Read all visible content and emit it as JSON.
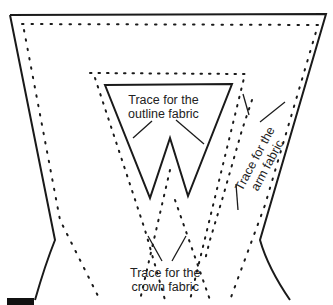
{
  "diagram": {
    "labels": {
      "outline": [
        "Trace for the",
        "outline fabric"
      ],
      "arm": [
        "Trace for the",
        "arm fabric"
      ],
      "crown": [
        "Trace for the",
        "crown fabric"
      ]
    },
    "colors": {
      "line": "#1a1a1a",
      "background": "#ffffff"
    }
  }
}
